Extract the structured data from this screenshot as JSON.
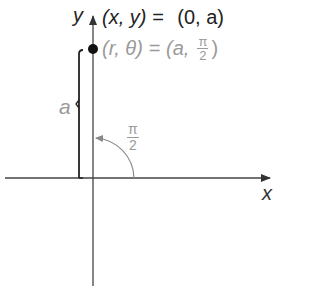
{
  "diagram": {
    "type": "polar-coordinate-point",
    "axes": {
      "x_label": "x",
      "y_label": "y"
    },
    "point": {
      "rect_label_lhs": "(x, y) =",
      "rect_label_rhs": "(0, a)",
      "polar_label_lhs": "(r, θ) =",
      "polar_label_a": "(a,",
      "polar_label_num": "π",
      "polar_label_den": "2",
      "polar_label_close": ")"
    },
    "distance_label": "a",
    "angle_label": {
      "numerator": "π",
      "denominator": "2"
    },
    "colors": {
      "axis": "#444444",
      "dark_text": "#222222",
      "gray_text": "#9a9a9a",
      "bracket": "#222222",
      "arc": "#888888",
      "point": "#111111"
    }
  }
}
